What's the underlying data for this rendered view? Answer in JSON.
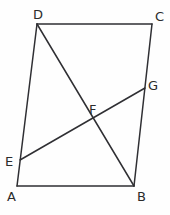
{
  "figure": {
    "background_color": "#fefefe",
    "stroke_color": "#2f2f33",
    "stroke_width": 1.5,
    "label_color": "#2b2b2b",
    "label_font_size": 13,
    "width": 170,
    "height": 215
  },
  "points": {
    "A": {
      "name": "A",
      "x": 17,
      "y": 186,
      "label_x": 7,
      "label_y": 190,
      "role": "quadrilateral-vertex"
    },
    "B": {
      "name": "B",
      "x": 134,
      "y": 186,
      "label_x": 137,
      "label_y": 190,
      "role": "quadrilateral-vertex"
    },
    "C": {
      "name": "C",
      "x": 152,
      "y": 24,
      "label_x": 155,
      "label_y": 10,
      "role": "quadrilateral-vertex"
    },
    "D": {
      "name": "D",
      "x": 37,
      "y": 24,
      "label_x": 33,
      "label_y": 8,
      "role": "quadrilateral-vertex"
    },
    "E": {
      "name": "E",
      "x": 20,
      "y": 160,
      "label_x": 5,
      "label_y": 155,
      "role": "point-on-side-AD"
    },
    "F": {
      "name": "F",
      "x": 93,
      "y": 115,
      "label_x": 89,
      "label_y": 103,
      "role": "intersection-DB-EG"
    },
    "G": {
      "name": "G",
      "x": 145,
      "y": 88,
      "label_x": 148,
      "label_y": 79,
      "role": "point-on-side-BC"
    }
  },
  "segments": [
    {
      "name": "side-AB",
      "from": "A",
      "to": "B",
      "x1": 17,
      "y1": 186,
      "x2": 134,
      "y2": 186
    },
    {
      "name": "side-BC",
      "from": "B",
      "to": "C",
      "x1": 134,
      "y1": 186,
      "x2": 152,
      "y2": 24
    },
    {
      "name": "side-CD",
      "from": "C",
      "to": "D",
      "x1": 152,
      "y1": 24,
      "x2": 37,
      "y2": 24
    },
    {
      "name": "side-DA",
      "from": "D",
      "to": "A",
      "x1": 37,
      "y1": 24,
      "x2": 17,
      "y2": 186
    },
    {
      "name": "diagonal-DB",
      "from": "D",
      "to": "B",
      "x1": 37,
      "y1": 24,
      "x2": 134,
      "y2": 186
    },
    {
      "name": "segment-EG",
      "from": "E",
      "to": "G",
      "x1": 20,
      "y1": 160,
      "x2": 145,
      "y2": 88
    }
  ],
  "labels": {
    "A": "A",
    "B": "B",
    "C": "C",
    "D": "D",
    "E": "E",
    "F": "F",
    "G": "G"
  }
}
